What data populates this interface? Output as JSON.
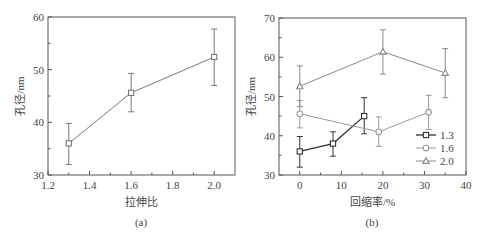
{
  "chart_data": [
    {
      "type": "line",
      "panel": "(a)",
      "title": "",
      "xlabel": "拉伸比",
      "ylabel": "孔径/nm",
      "xlim": [
        1.2,
        2.1
      ],
      "ylim": [
        30,
        60
      ],
      "xticks": [
        "1.2",
        "1.4",
        "1.6",
        "1.8",
        "2.0"
      ],
      "yticks": [
        "30",
        "40",
        "50",
        "60"
      ],
      "grid": false,
      "legend": null,
      "series": [
        {
          "name": "",
          "marker": "square",
          "color": "#777777",
          "x": [
            1.3,
            1.6,
            2.0
          ],
          "values": [
            36.0,
            45.6,
            52.4
          ],
          "err_low": [
            32.0,
            42.0,
            47.0
          ],
          "err_high": [
            39.8,
            49.3,
            57.7
          ]
        }
      ]
    },
    {
      "type": "line",
      "panel": "(b)",
      "title": "",
      "xlabel": "回缩率/%",
      "ylabel": "孔径/nm",
      "xlim": [
        -5,
        40
      ],
      "ylim": [
        30,
        70
      ],
      "xticks": [
        "0",
        "10",
        "20",
        "30",
        "40"
      ],
      "yticks": [
        "30",
        "40",
        "50",
        "60",
        "70"
      ],
      "grid": false,
      "legend_position": "lower right",
      "series": [
        {
          "name": "1.3",
          "marker": "square",
          "color": "#333333",
          "x": [
            0,
            8,
            15.5
          ],
          "values": [
            36.0,
            38.0,
            45.0
          ],
          "err_low": [
            32.0,
            34.8,
            40.5
          ],
          "err_high": [
            39.8,
            41.0,
            49.7
          ]
        },
        {
          "name": "1.6",
          "marker": "circle",
          "color": "#999999",
          "x": [
            0,
            19,
            31
          ],
          "values": [
            45.6,
            41.0,
            46.0
          ],
          "err_low": [
            42.0,
            37.3,
            41.6
          ],
          "err_high": [
            49.0,
            44.8,
            50.3
          ]
        },
        {
          "name": "2.0",
          "marker": "triangle",
          "color": "#888888",
          "x": [
            0,
            20,
            35
          ],
          "values": [
            52.6,
            61.4,
            56.0
          ],
          "err_low": [
            47.4,
            55.7,
            49.7
          ],
          "err_high": [
            57.8,
            67.0,
            62.2
          ]
        }
      ]
    }
  ],
  "panels": {
    "a": {
      "caption": "(a)",
      "xlabel": "拉伸比",
      "ylabel": "孔径/nm"
    },
    "b": {
      "caption": "(b)",
      "xlabel": "回缩率/%",
      "ylabel": "孔径/nm"
    }
  }
}
